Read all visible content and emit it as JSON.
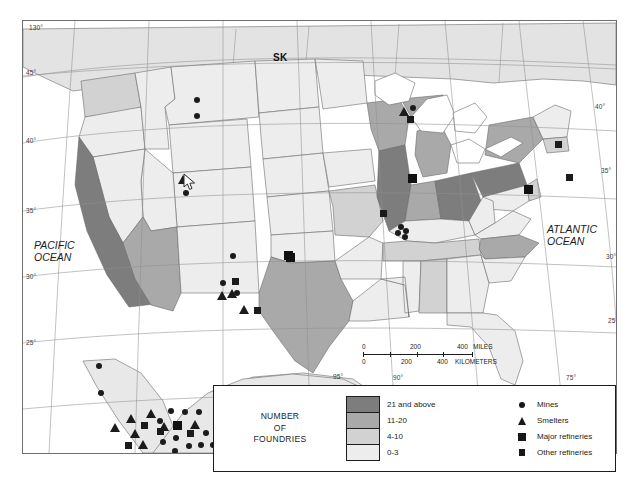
{
  "map": {
    "title_region": "United States copper industry distribution map",
    "province_labels": [
      {
        "text": "SK",
        "x": 250,
        "y": 31
      }
    ],
    "ocean_labels": [
      {
        "name": "pacific-ocean-label",
        "lines": [
          "PACIFIC",
          "OCEAN"
        ],
        "x": 33,
        "y": 238
      },
      {
        "name": "atlantic-ocean-label",
        "lines": [
          "ATLANTIC",
          "OCEAN"
        ],
        "x": 546,
        "y": 222
      }
    ],
    "graticule_labels": [
      {
        "text": "130°",
        "x": 28,
        "y": 26
      },
      {
        "text": "45°",
        "x": 25,
        "y": 71
      },
      {
        "text": "40°",
        "x": 25,
        "y": 138
      },
      {
        "text": "35°",
        "x": 25,
        "y": 208
      },
      {
        "text": "30°",
        "x": 25,
        "y": 275
      },
      {
        "text": "25°",
        "x": 25,
        "y": 343
      },
      {
        "text": "40°",
        "x": 608,
        "y": 104
      },
      {
        "text": "35°",
        "x": 608,
        "y": 166
      },
      {
        "text": "30°",
        "x": 608,
        "y": 252
      },
      {
        "text": "25°",
        "x": 608,
        "y": 317
      },
      {
        "text": "75°",
        "x": 578,
        "y": 373
      },
      {
        "text": "95°",
        "x": 338,
        "y": 375
      },
      {
        "text": "90°",
        "x": 396,
        "y": 375
      }
    ],
    "scalebar": {
      "miles_ticks": [
        "0",
        "200",
        "400"
      ],
      "miles_unit": "MILES",
      "km_ticks": [
        "0",
        "200",
        "400"
      ],
      "km_unit": "KILOMETERS"
    }
  },
  "legend": {
    "foundries_title": [
      "NUMBER",
      "OF",
      "FOUNDRIES"
    ],
    "classes": [
      {
        "label": "21 and above",
        "color": "#7d7d7d"
      },
      {
        "label": "11-20",
        "color": "#a9a9a9"
      },
      {
        "label": "4-10",
        "color": "#d2d2d2"
      },
      {
        "label": "0-3",
        "color": "#ededed"
      }
    ],
    "symbols": [
      {
        "label": "Mines",
        "shape": "circle"
      },
      {
        "label": "Smelters",
        "shape": "triangle"
      },
      {
        "label": "Major refineries",
        "shape": "square-large"
      },
      {
        "label": "Other refineries",
        "shape": "square-small"
      }
    ]
  },
  "chart_data": {
    "type": "map",
    "classification_field": "number_of_foundries",
    "class_breaks": [
      "0-3",
      "4-10",
      "11-20",
      "21 and above"
    ],
    "class_colors": [
      "#ededed",
      "#d2d2d2",
      "#a9a9a9",
      "#7d7d7d"
    ],
    "states": [
      {
        "name": "California",
        "class": "21 and above"
      },
      {
        "name": "Illinois",
        "class": "21 and above"
      },
      {
        "name": "Ohio",
        "class": "21 and above"
      },
      {
        "name": "Pennsylvania",
        "class": "21 and above"
      },
      {
        "name": "Wisconsin",
        "class": "11-20"
      },
      {
        "name": "Michigan",
        "class": "11-20"
      },
      {
        "name": "Indiana",
        "class": "11-20"
      },
      {
        "name": "New York",
        "class": "11-20"
      },
      {
        "name": "Texas",
        "class": "11-20"
      },
      {
        "name": "Arizona",
        "class": "11-20"
      },
      {
        "name": "North Carolina",
        "class": "11-20"
      },
      {
        "name": "Alabama",
        "class": "4-10"
      },
      {
        "name": "New Jersey",
        "class": "4-10"
      },
      {
        "name": "Tennessee",
        "class": "4-10"
      },
      {
        "name": "Missouri",
        "class": "4-10"
      },
      {
        "name": "Washington",
        "class": "4-10"
      },
      {
        "name": "Oregon",
        "class": "0-3"
      },
      {
        "name": "Nevada",
        "class": "0-3"
      },
      {
        "name": "Idaho",
        "class": "0-3"
      },
      {
        "name": "Montana",
        "class": "0-3"
      },
      {
        "name": "Wyoming",
        "class": "0-3"
      },
      {
        "name": "Utah",
        "class": "0-3"
      },
      {
        "name": "Colorado",
        "class": "0-3"
      },
      {
        "name": "New Mexico",
        "class": "0-3"
      },
      {
        "name": "North Dakota",
        "class": "0-3"
      },
      {
        "name": "South Dakota",
        "class": "0-3"
      },
      {
        "name": "Nebraska",
        "class": "0-3"
      },
      {
        "name": "Kansas",
        "class": "0-3"
      },
      {
        "name": "Oklahoma",
        "class": "0-3"
      },
      {
        "name": "Minnesota",
        "class": "0-3"
      },
      {
        "name": "Iowa",
        "class": "0-3"
      },
      {
        "name": "Arkansas",
        "class": "0-3"
      },
      {
        "name": "Louisiana",
        "class": "0-3"
      },
      {
        "name": "Mississippi",
        "class": "0-3"
      },
      {
        "name": "Kentucky",
        "class": "0-3"
      },
      {
        "name": "West Virginia",
        "class": "0-3"
      },
      {
        "name": "Virginia",
        "class": "0-3"
      },
      {
        "name": "South Carolina",
        "class": "0-3"
      },
      {
        "name": "Georgia",
        "class": "0-3"
      },
      {
        "name": "Florida",
        "class": "0-3"
      },
      {
        "name": "Maryland",
        "class": "0-3"
      },
      {
        "name": "Delaware",
        "class": "0-3"
      },
      {
        "name": "Maine",
        "class": "0-3"
      },
      {
        "name": "Vermont",
        "class": "0-3"
      },
      {
        "name": "New Hampshire",
        "class": "0-3"
      },
      {
        "name": "Massachusetts",
        "class": "0-3"
      },
      {
        "name": "Connecticut",
        "class": "0-3"
      },
      {
        "name": "Rhode Island",
        "class": "0-3"
      }
    ],
    "points": [
      {
        "type": "mine",
        "x": 174,
        "y": 79
      },
      {
        "type": "mine",
        "x": 174,
        "y": 95
      },
      {
        "type": "mine",
        "x": 163,
        "y": 172
      },
      {
        "type": "smelter",
        "x": 160,
        "y": 158
      },
      {
        "type": "mine",
        "x": 210,
        "y": 235
      },
      {
        "type": "mine",
        "x": 200,
        "y": 262
      },
      {
        "type": "other",
        "x": 212,
        "y": 260
      },
      {
        "type": "mine",
        "x": 214,
        "y": 272
      },
      {
        "type": "smelter",
        "x": 199,
        "y": 274
      },
      {
        "type": "smelter",
        "x": 209,
        "y": 272
      },
      {
        "type": "smelter",
        "x": 221,
        "y": 288
      },
      {
        "type": "other",
        "x": 234,
        "y": 289
      },
      {
        "type": "major",
        "x": 267,
        "y": 236
      },
      {
        "type": "major",
        "x": 265,
        "y": 234
      },
      {
        "type": "mine",
        "x": 76,
        "y": 345
      },
      {
        "type": "mine",
        "x": 78,
        "y": 372
      },
      {
        "type": "smelter",
        "x": 92,
        "y": 406
      },
      {
        "type": "smelter",
        "x": 108,
        "y": 397
      },
      {
        "type": "smelter",
        "x": 128,
        "y": 392
      },
      {
        "type": "smelter",
        "x": 112,
        "y": 412
      },
      {
        "type": "smelter",
        "x": 120,
        "y": 423
      },
      {
        "type": "smelter",
        "x": 141,
        "y": 405
      },
      {
        "type": "smelter",
        "x": 172,
        "y": 403
      },
      {
        "type": "mine",
        "x": 148,
        "y": 390
      },
      {
        "type": "mine",
        "x": 162,
        "y": 391
      },
      {
        "type": "mine",
        "x": 176,
        "y": 391
      },
      {
        "type": "mine",
        "x": 137,
        "y": 400
      },
      {
        "type": "mine",
        "x": 153,
        "y": 417
      },
      {
        "type": "mine",
        "x": 140,
        "y": 421
      },
      {
        "type": "mine",
        "x": 152,
        "y": 430
      },
      {
        "type": "mine",
        "x": 166,
        "y": 425
      },
      {
        "type": "mine",
        "x": 178,
        "y": 424
      },
      {
        "type": "mine",
        "x": 190,
        "y": 424
      },
      {
        "type": "mine",
        "x": 165,
        "y": 437
      },
      {
        "type": "mine",
        "x": 183,
        "y": 412
      },
      {
        "type": "other",
        "x": 121,
        "y": 404
      },
      {
        "type": "other",
        "x": 137,
        "y": 410
      },
      {
        "type": "other",
        "x": 105,
        "y": 424
      },
      {
        "type": "major",
        "x": 154,
        "y": 404
      },
      {
        "type": "other",
        "x": 167,
        "y": 412
      },
      {
        "type": "other",
        "x": 197,
        "y": 411
      },
      {
        "type": "smelter",
        "x": 381,
        "y": 90
      },
      {
        "type": "mine",
        "x": 390,
        "y": 87
      },
      {
        "type": "other",
        "x": 387,
        "y": 98
      },
      {
        "type": "major",
        "x": 389,
        "y": 157
      },
      {
        "type": "other",
        "x": 360,
        "y": 192
      },
      {
        "type": "mine",
        "x": 378,
        "y": 206
      },
      {
        "type": "mine",
        "x": 383,
        "y": 210
      },
      {
        "type": "mine",
        "x": 375,
        "y": 212
      },
      {
        "type": "mine",
        "x": 382,
        "y": 216
      },
      {
        "type": "other",
        "x": 535,
        "y": 123
      },
      {
        "type": "major",
        "x": 505,
        "y": 168
      },
      {
        "type": "other",
        "x": 546,
        "y": 156
      }
    ]
  }
}
